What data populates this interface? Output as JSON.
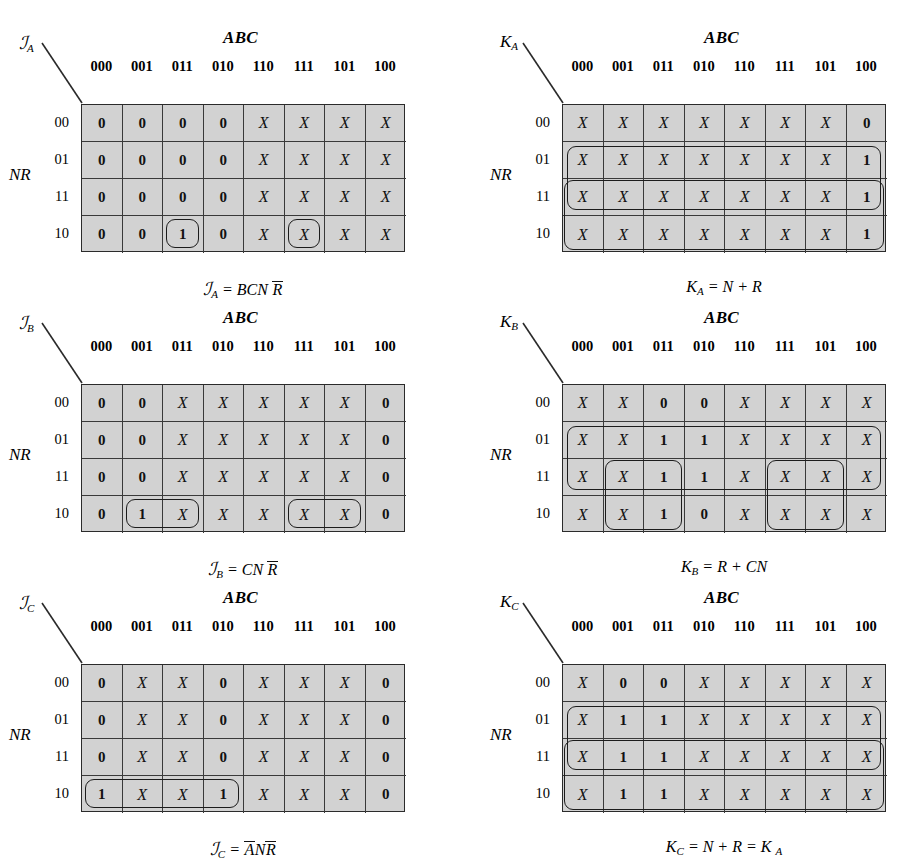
{
  "figure": {
    "col_header_title": "ABC",
    "row_header_title": "NR",
    "columns": [
      "000",
      "001",
      "011",
      "010",
      "110",
      "111",
      "101",
      "100"
    ],
    "rows": [
      "00",
      "01",
      "11",
      "10"
    ],
    "cell_bg": "#d2d2d2",
    "line_color": "#2b2b2b"
  },
  "maps": [
    {
      "id": "JA",
      "corner_label": "J",
      "corner_sub": "A",
      "corner_script": true,
      "formula_lead": "J",
      "formula_sub": "A",
      "formula_rest": "= BCN",
      "formula_bar": "R",
      "formula_tail": "",
      "values": [
        [
          "0",
          "0",
          "0",
          "0",
          "X",
          "X",
          "X",
          "X"
        ],
        [
          "0",
          "0",
          "0",
          "0",
          "X",
          "X",
          "X",
          "X"
        ],
        [
          "0",
          "0",
          "0",
          "0",
          "X",
          "X",
          "X",
          "X"
        ],
        [
          "0",
          "0",
          "1",
          "0",
          "X",
          "X",
          "X",
          "X"
        ]
      ],
      "loops": [
        {
          "row": 3,
          "col": 2,
          "rowspan": 1,
          "colspan": 1
        },
        {
          "row": 3,
          "col": 5,
          "rowspan": 1,
          "colspan": 1
        }
      ]
    },
    {
      "id": "KA",
      "corner_label": "K",
      "corner_sub": "A",
      "corner_script": false,
      "formula_lead": "K",
      "formula_sub": "A",
      "formula_rest": "= N + R",
      "formula_bar": "",
      "formula_tail": "",
      "values": [
        [
          "X",
          "X",
          "X",
          "X",
          "X",
          "X",
          "X",
          "0"
        ],
        [
          "X",
          "X",
          "X",
          "X",
          "X",
          "X",
          "X",
          "1"
        ],
        [
          "X",
          "X",
          "X",
          "X",
          "X",
          "X",
          "X",
          "1"
        ],
        [
          "X",
          "X",
          "X",
          "X",
          "X",
          "X",
          "X",
          "1"
        ]
      ],
      "loops": [
        {
          "row": 1,
          "col": 0,
          "rowspan": 2,
          "colspan": 8,
          "inset": 5
        },
        {
          "row": 2,
          "col": 0,
          "rowspan": 2,
          "colspan": 8,
          "inset": 2
        }
      ]
    },
    {
      "id": "JB",
      "corner_label": "J",
      "corner_sub": "B",
      "corner_script": true,
      "formula_lead": "J",
      "formula_sub": "B",
      "formula_rest": "= CN",
      "formula_bar": "R",
      "formula_tail": "",
      "values": [
        [
          "0",
          "0",
          "X",
          "X",
          "X",
          "X",
          "X",
          "0"
        ],
        [
          "0",
          "0",
          "X",
          "X",
          "X",
          "X",
          "X",
          "0"
        ],
        [
          "0",
          "0",
          "X",
          "X",
          "X",
          "X",
          "X",
          "0"
        ],
        [
          "0",
          "1",
          "X",
          "X",
          "X",
          "X",
          "X",
          "0"
        ]
      ],
      "loops": [
        {
          "row": 3,
          "col": 1,
          "rowspan": 1,
          "colspan": 2
        },
        {
          "row": 3,
          "col": 5,
          "rowspan": 1,
          "colspan": 2
        }
      ]
    },
    {
      "id": "KB",
      "corner_label": "K",
      "corner_sub": "B",
      "corner_script": false,
      "formula_lead": "K",
      "formula_sub": "B",
      "formula_rest": "= R + CN",
      "formula_bar": "",
      "formula_tail": "",
      "values": [
        [
          "X",
          "X",
          "0",
          "0",
          "X",
          "X",
          "X",
          "X"
        ],
        [
          "X",
          "X",
          "1",
          "1",
          "X",
          "X",
          "X",
          "X"
        ],
        [
          "X",
          "X",
          "1",
          "1",
          "X",
          "X",
          "X",
          "X"
        ],
        [
          "X",
          "X",
          "1",
          "0",
          "X",
          "X",
          "X",
          "X"
        ]
      ],
      "loops": [
        {
          "row": 1,
          "col": 0,
          "rowspan": 2,
          "colspan": 8,
          "inset": 5
        },
        {
          "row": 2,
          "col": 1,
          "rowspan": 2,
          "colspan": 2,
          "inset": 2
        },
        {
          "row": 2,
          "col": 5,
          "rowspan": 2,
          "colspan": 2,
          "inset": 2
        }
      ]
    },
    {
      "id": "JC",
      "corner_label": "J",
      "corner_sub": "C",
      "corner_script": true,
      "formula_lead": "J",
      "formula_sub": "C",
      "formula_rest": "=",
      "formula_bar": "A",
      "formula_tail": "N",
      "formula_bar2": "R",
      "values": [
        [
          "0",
          "X",
          "X",
          "0",
          "X",
          "X",
          "X",
          "0"
        ],
        [
          "0",
          "X",
          "X",
          "0",
          "X",
          "X",
          "X",
          "0"
        ],
        [
          "0",
          "X",
          "X",
          "0",
          "X",
          "X",
          "X",
          "0"
        ],
        [
          "1",
          "X",
          "X",
          "1",
          "X",
          "X",
          "X",
          "0"
        ]
      ],
      "loops": [
        {
          "row": 3,
          "col": 0,
          "rowspan": 1,
          "colspan": 4
        }
      ]
    },
    {
      "id": "KC",
      "corner_label": "K",
      "corner_sub": "C",
      "corner_script": false,
      "formula_lead": "K",
      "formula_sub": "C",
      "formula_rest": "= N + R = K",
      "formula_sub2": "A",
      "formula_bar": "",
      "formula_tail": "",
      "values": [
        [
          "X",
          "0",
          "0",
          "X",
          "X",
          "X",
          "X",
          "X"
        ],
        [
          "X",
          "1",
          "1",
          "X",
          "X",
          "X",
          "X",
          "X"
        ],
        [
          "X",
          "1",
          "1",
          "X",
          "X",
          "X",
          "X",
          "X"
        ],
        [
          "X",
          "1",
          "1",
          "X",
          "X",
          "X",
          "X",
          "X"
        ]
      ],
      "loops": [
        {
          "row": 1,
          "col": 0,
          "rowspan": 2,
          "colspan": 8,
          "inset": 5
        },
        {
          "row": 2,
          "col": 0,
          "rowspan": 2,
          "colspan": 8,
          "inset": 2
        }
      ]
    }
  ]
}
